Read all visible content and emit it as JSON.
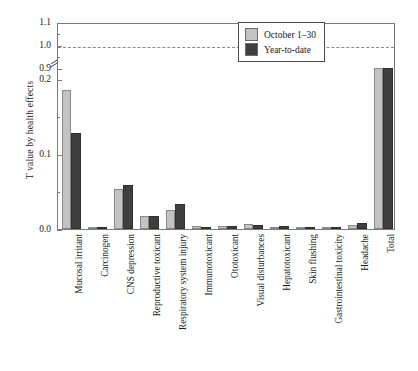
{
  "chart_data": {
    "type": "bar",
    "title": "",
    "xlabel": "",
    "ylabel": "T value by health effects",
    "categories": [
      "Mucosal irritant",
      "Carcinogen",
      "CNS depression",
      "Reproductive toxicant",
      "Respiratory system injury",
      "Immunotoxicant",
      "Ototoxicant",
      "Visual disturbances",
      "Hepatotoxicant",
      "Skin flushing",
      "Gastrointestinal toxicity",
      "Headache",
      "Total"
    ],
    "series": [
      {
        "name": "October 1–30",
        "color": "#c3c3c3",
        "values": [
          0.185,
          0.001,
          0.053,
          0.018,
          0.025,
          0.004,
          0.004,
          0.007,
          0.003,
          0.003,
          0.002,
          0.006,
          0.87
        ]
      },
      {
        "name": "Year-to-date",
        "color": "#3f3f3f",
        "values": [
          0.128,
          0.001,
          0.059,
          0.017,
          0.034,
          0.003,
          0.004,
          0.005,
          0.004,
          0.002,
          0.002,
          0.008,
          0.71
        ]
      }
    ],
    "y_ticks_labeled": [
      "0.0",
      "0.1",
      "0.2",
      "0.9",
      "1.0",
      "1.1"
    ],
    "y_ticks_minor": [
      0.05,
      0.15,
      0.95,
      1.05
    ],
    "ylim_lower_segment": [
      0.0,
      0.2
    ],
    "ylim_upper_segment": [
      0.9,
      1.1
    ],
    "axis_break": true,
    "axis_break_note": "broken y-axis between 0.2 and 0.9",
    "reference_line": {
      "value": 1.0,
      "style": "dashed",
      "color": "#8a8a8a"
    },
    "grid": false,
    "legend_position": "top-right"
  },
  "legend": {
    "entries": [
      {
        "label": "October 1–30"
      },
      {
        "label": "Year-to-date"
      }
    ]
  }
}
